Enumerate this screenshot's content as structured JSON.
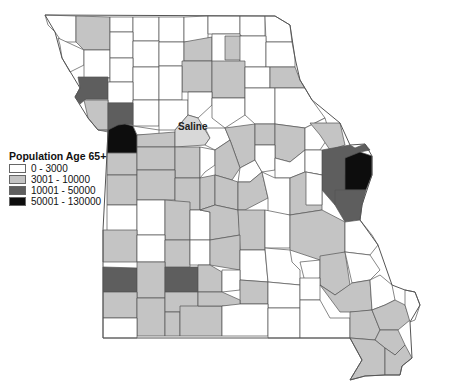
{
  "map": {
    "region": "Missouri",
    "unit": "counties",
    "labels": [
      {
        "text": "Saline",
        "x": 178,
        "y": 121
      }
    ]
  },
  "legend": {
    "title": "Population Age 65+",
    "classes": [
      {
        "label": "0 - 3000",
        "color": "#ffffff"
      },
      {
        "label": "3001 - 10000",
        "color": "#c4c4c4"
      },
      {
        "label": "10001 - 50000",
        "color": "#5e5e5e"
      },
      {
        "label": "50001 - 130000",
        "color": "#0d0d0d"
      }
    ]
  },
  "colors": {
    "c0": "#ffffff",
    "c1": "#c4c4c4",
    "c2": "#5e5e5e",
    "c3": "#0d0d0d",
    "border": "#555555"
  }
}
